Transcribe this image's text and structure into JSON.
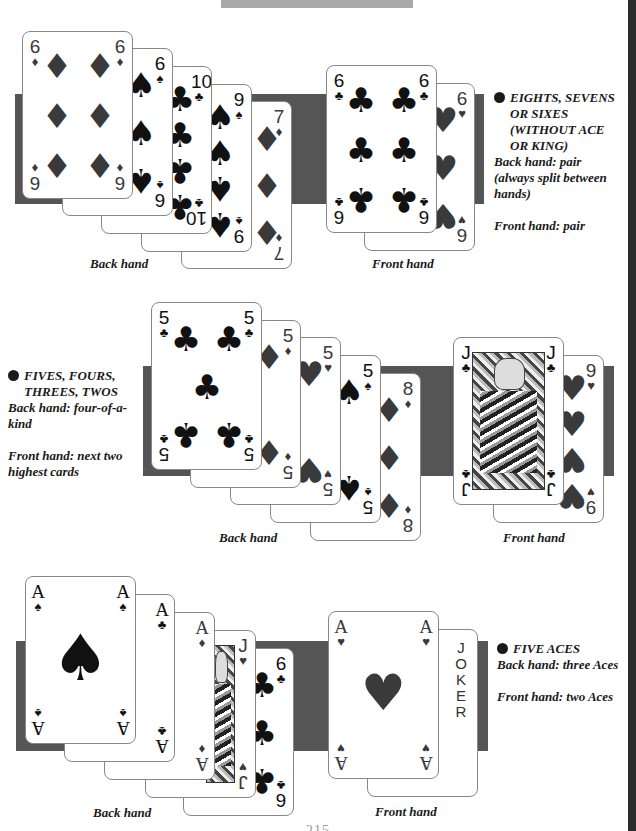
{
  "page": {
    "page_number_partial": "215",
    "colors": {
      "band": "#555555",
      "topbar": "#a9a9a9",
      "rightbar": "#2b2b2b",
      "red_suit": "#3a3a3a",
      "black_suit": "#111111"
    }
  },
  "sections": [
    {
      "id": "eights-sevens-sixes",
      "note": {
        "heading_lines": [
          "EIGHTS, SEVENS",
          "OR SIXES",
          "(WITHOUT ACE",
          "OR KING)"
        ],
        "back_hand": [
          "Back hand: pair",
          "(always split between",
          "hands)"
        ],
        "front_hand": [
          "Front hand: pair"
        ]
      },
      "back_hand_caption": "Back hand",
      "front_hand_caption": "Front hand",
      "back_hand_cards": [
        {
          "rank": "6",
          "suit": "♦"
        },
        {
          "rank": "6",
          "suit": "♠"
        },
        {
          "rank": "10",
          "suit": "♣"
        },
        {
          "rank": "9",
          "suit": "♠"
        },
        {
          "rank": "7",
          "suit": "♦"
        }
      ],
      "front_hand_cards": [
        {
          "rank": "6",
          "suit": "♣"
        },
        {
          "rank": "6",
          "suit": "♥"
        }
      ]
    },
    {
      "id": "fives-fours-threes-twos",
      "note": {
        "heading_lines": [
          "FIVES, FOURS,",
          "THREES, TWOS"
        ],
        "back_hand": [
          "Back hand: four-of-a-kind"
        ],
        "front_hand": [
          "Front hand: next two",
          "highest cards"
        ]
      },
      "back_hand_caption": "Back hand",
      "front_hand_caption": "Front hand",
      "back_hand_cards": [
        {
          "rank": "5",
          "suit": "♣"
        },
        {
          "rank": "5",
          "suit": "♦"
        },
        {
          "rank": "5",
          "suit": "♥"
        },
        {
          "rank": "5",
          "suit": "♠"
        },
        {
          "rank": "8",
          "suit": "♦"
        }
      ],
      "front_hand_cards": [
        {
          "rank": "J",
          "suit": "♣"
        },
        {
          "rank": "9",
          "suit": "♥"
        }
      ]
    },
    {
      "id": "five-aces",
      "note": {
        "heading_lines": [
          "FIVE ACES"
        ],
        "back_hand": [
          "Back hand: three Aces"
        ],
        "front_hand": [
          "Front hand: two Aces"
        ]
      },
      "back_hand_caption": "Back hand",
      "front_hand_caption": "Front hand",
      "back_hand_cards": [
        {
          "rank": "A",
          "suit": "♠"
        },
        {
          "rank": "A",
          "suit": "♣"
        },
        {
          "rank": "A",
          "suit": "♦"
        },
        {
          "rank": "J",
          "suit": "♥"
        },
        {
          "rank": "6",
          "suit": "♣"
        }
      ],
      "front_hand_cards": [
        {
          "rank": "A",
          "suit": "♥"
        },
        {
          "rank": "JOKER",
          "suit": ""
        }
      ],
      "joker_letters": [
        "J",
        "O",
        "K",
        "E",
        "R"
      ]
    }
  ]
}
